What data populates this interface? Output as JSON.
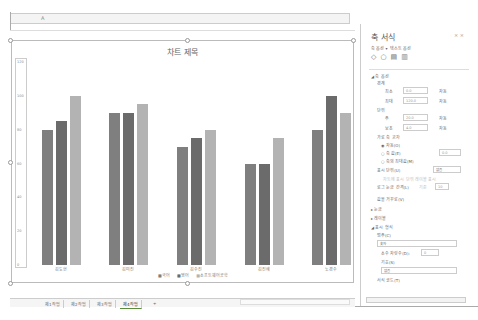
{
  "formula_bar": {
    "name_box": "",
    "fx_label": "A"
  },
  "chart": {
    "title": "차트 제목",
    "y_ticks": [
      "120",
      "100",
      "80",
      "60",
      "40",
      "20",
      "0"
    ],
    "legend": [
      "국어",
      "영어",
      "소프트웨어공학"
    ]
  },
  "chart_data": {
    "type": "bar",
    "title": "차트 제목",
    "categories": [
      "김도현",
      "김미진",
      "김수진",
      "김진혜",
      "노경수"
    ],
    "series": [
      {
        "name": "국어",
        "values": [
          80,
          90,
          70,
          60,
          80
        ],
        "color": "#7f7f7f"
      },
      {
        "name": "영어",
        "values": [
          85,
          90,
          75,
          60,
          100
        ],
        "color": "#6b6b6b"
      },
      {
        "name": "소프트웨어공학",
        "values": [
          100,
          95,
          80,
          75,
          90
        ],
        "color": "#b3b3b3"
      }
    ],
    "xlabel": "",
    "ylabel": "",
    "ylim": [
      0,
      120
    ],
    "grid": false,
    "legend_position": "bottom"
  },
  "sheet_tabs": [
    "제1작업",
    "제2작업",
    "제3작업",
    "제4작업"
  ],
  "add_sheet_label": "+",
  "panel": {
    "title": "축 서식",
    "close": "× ×",
    "tab_axis": "축 옵션 ▾",
    "tab_text": "텍스트 옵션",
    "section_axis_options": "◢ 축 옵션",
    "bounds_label": "경계",
    "min_label": "최소",
    "min_value": "0.0",
    "min_auto": "자동",
    "max_label": "최대",
    "max_value": "120.0",
    "max_auto": "자동",
    "units_label": "단위",
    "major_label": "주",
    "major_value": "20.0",
    "major_auto": "자동",
    "minor_label": "보조",
    "minor_value": "4.0",
    "minor_auto": "자동",
    "cross_label": "가로 축 교차",
    "auto_option": "◉ 자동(O)",
    "axis_value_option": "○ 축 값(E)",
    "axis_value": "0.0",
    "max_axis_option": "○ 축의 최대값(M)",
    "display_units_label": "표시 단위(U)",
    "display_units_value": "없음",
    "show_units_label": "차트에 표시 단위 레이블 표시",
    "log_scale_label": "로그 눈금 간격(L)",
    "log_base_label": "기준",
    "log_base_value": "10",
    "reverse_label": "값을 거꾸로(V)",
    "section_ticks": "▸ 눈금",
    "section_labels": "▸ 레이블",
    "section_number": "◢ 표시 형식",
    "category_label": "범주(C)",
    "category_value": "숫자",
    "decimal_label": "소수 자릿수(D):",
    "decimal_value": "0",
    "symbol_label": "기호(S)",
    "symbol_value": "없음",
    "format_code_label": "서식 코드(T)"
  }
}
